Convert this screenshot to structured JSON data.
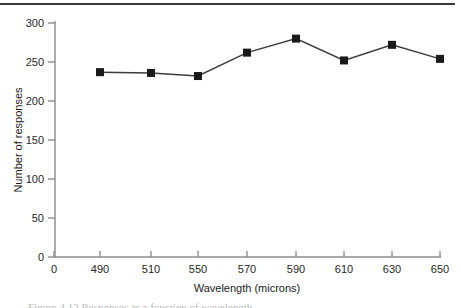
{
  "figure": {
    "top_rule_color": "#3a3a3a",
    "background_color": "#ffffff",
    "caption_partial": "Figure 4.12   Responses as a function of wavelength"
  },
  "chart_data": {
    "type": "line",
    "title": "",
    "subtitle": "",
    "xlabel": "Wavelength (microns)",
    "ylabel": "Number of responses",
    "x": [
      490,
      510,
      550,
      570,
      590,
      610,
      630,
      650
    ],
    "values": [
      237,
      236,
      232,
      262,
      280,
      252,
      272,
      254
    ],
    "series": [
      {
        "name": "Number of responses",
        "values": [
          237,
          236,
          232,
          262,
          280,
          252,
          272,
          254
        ]
      }
    ],
    "xtick_labels": [
      "0",
      "490",
      "510",
      "550",
      "570",
      "590",
      "610",
      "630",
      "650"
    ],
    "ytick_labels": [
      "0",
      "50",
      "100",
      "150",
      "200",
      "250",
      "300"
    ],
    "ylim": [
      0,
      300
    ],
    "grid": false,
    "legend_position": "none",
    "marker": "square",
    "marker_color": "#1a1a1a",
    "line_color": "#3c3c3c",
    "axis_color": "#8c8c8c"
  }
}
